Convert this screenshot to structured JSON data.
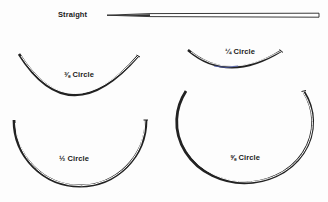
{
  "diagram": {
    "needles": [
      {
        "id": "straight",
        "label": "Straight"
      },
      {
        "id": "three-eighths",
        "label": "⅜ Circle"
      },
      {
        "id": "quarter",
        "label": "¼ Circle"
      },
      {
        "id": "half",
        "label": "½ Circle"
      },
      {
        "id": "five-eighths",
        "label": "⅝ Circle"
      }
    ],
    "colors": {
      "stroke": "#222222",
      "inner": "#ffffff",
      "accent_blue": "#4a5bb0"
    }
  }
}
